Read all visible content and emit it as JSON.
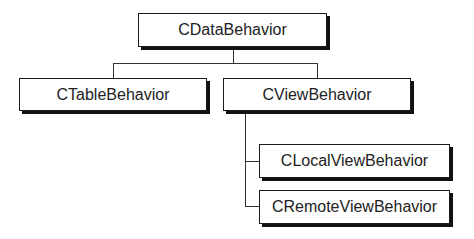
{
  "diagram": {
    "type": "class-hierarchy",
    "root": {
      "label": "CDataBehavior",
      "children": [
        {
          "label": "CTableBehavior",
          "children": []
        },
        {
          "label": "CViewBehavior",
          "children": [
            {
              "label": "CLocalViewBehavior",
              "children": []
            },
            {
              "label": "CRemoteViewBehavior",
              "children": []
            }
          ]
        }
      ]
    },
    "nodes": [
      {
        "id": "cdatabehavior",
        "label": "CDataBehavior"
      },
      {
        "id": "ctablebehavior",
        "label": "CTableBehavior"
      },
      {
        "id": "cviewbehavior",
        "label": "CViewBehavior"
      },
      {
        "id": "clocalviewbehavior",
        "label": "CLocalViewBehavior"
      },
      {
        "id": "cremoteviewbehavior",
        "label": "CRemoteViewBehavior"
      }
    ],
    "edges": [
      {
        "from": "cdatabehavior",
        "to": "ctablebehavior"
      },
      {
        "from": "cdatabehavior",
        "to": "cviewbehavior"
      },
      {
        "from": "cviewbehavior",
        "to": "clocalviewbehavior"
      },
      {
        "from": "cviewbehavior",
        "to": "cremoteviewbehavior"
      }
    ]
  }
}
